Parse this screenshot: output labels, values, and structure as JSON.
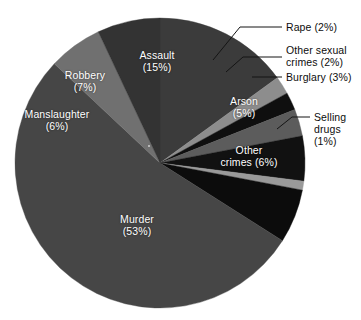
{
  "chart_data": {
    "type": "pie",
    "title": "",
    "subtitle": "",
    "xlabel": "",
    "ylabel": "",
    "legend_position": "none",
    "grid": false,
    "units": "percent",
    "total": 100,
    "categories": [
      "Assault",
      "Rape",
      "Other sexual crimes",
      "Burglary",
      "Arson",
      "Selling drugs",
      "Other crimes",
      "Murder",
      "Manslaughter",
      "Robbery"
    ],
    "values": [
      15,
      2,
      2,
      3,
      5,
      1,
      6,
      53,
      6,
      7
    ],
    "slices": [
      {
        "label": "Assault",
        "value": 15,
        "value_text": "(15%)",
        "color": "#3b3b3b",
        "label_placement": "inside",
        "label_lines": [
          "Assault",
          "(15%)"
        ]
      },
      {
        "label": "Rape",
        "value": 2,
        "value_text": "(2%)",
        "color": "#8d8d8d",
        "label_placement": "callout",
        "label_lines": [
          "Rape (2%)"
        ]
      },
      {
        "label": "Other sexual crimes",
        "value": 2,
        "value_text": "(2%)",
        "color": "#0f0f0f",
        "label_placement": "callout",
        "label_lines": [
          "Other sexual",
          "crimes (2%)"
        ]
      },
      {
        "label": "Burglary",
        "value": 3,
        "value_text": "(3%)",
        "color": "#5c5c5c",
        "label_placement": "callout",
        "label_lines": [
          "Burglary (3%)"
        ]
      },
      {
        "label": "Arson",
        "value": 5,
        "value_text": "(5%)",
        "color": "#111111",
        "label_placement": "inside",
        "label_lines": [
          "Arson",
          "(5%)"
        ]
      },
      {
        "label": "Selling drugs",
        "value": 1,
        "value_text": "(1%)",
        "color": "#9a9a9a",
        "label_placement": "callout",
        "label_lines": [
          "Selling",
          "drugs",
          "(1%)"
        ]
      },
      {
        "label": "Other crimes",
        "value": 6,
        "value_text": "(6%)",
        "color": "#0c0c0c",
        "label_placement": "inside",
        "label_lines": [
          "Other",
          "crimes (6%)"
        ]
      },
      {
        "label": "Murder",
        "value": 53,
        "value_text": "(53%)",
        "color": "#464646",
        "label_placement": "inside",
        "label_lines": [
          "Murder",
          "(53%)"
        ]
      },
      {
        "label": "Manslaughter",
        "value": 6,
        "value_text": "(6%)",
        "color": "#707070",
        "label_placement": "inside",
        "label_lines": [
          "Manslaughter",
          "(6%)"
        ]
      },
      {
        "label": "Robbery",
        "value": 7,
        "value_text": "(7%)",
        "color": "#333333",
        "label_placement": "inside",
        "label_lines": [
          "Robbery",
          "(7%)"
        ]
      }
    ]
  },
  "labels": {
    "assault_l1": "Assault",
    "assault_l2": "(15%)",
    "robbery_l1": "Robbery",
    "robbery_l2": "(7%)",
    "manslaughter_l1": "Manslaughter",
    "manslaughter_l2": "(6%)",
    "murder_l1": "Murder",
    "murder_l2": "(53%)",
    "arson_l1": "Arson",
    "arson_l2": "(5%)",
    "other_crimes_l1": "Other",
    "other_crimes_l2": "crimes (6%)",
    "rape_l1": "Rape (2%)",
    "other_sexual_l1": "Other sexual",
    "other_sexual_l2": "crimes (2%)",
    "burglary_l1": "Burglary (3%)",
    "selling_drugs_l1": "Selling",
    "selling_drugs_l2": "drugs",
    "selling_drugs_l3": "(1%)"
  },
  "colors": {
    "background": "#ffffff",
    "label_inside": "#ffffff",
    "label_outside": "#0d0d0d",
    "leader_line": "#141414"
  }
}
